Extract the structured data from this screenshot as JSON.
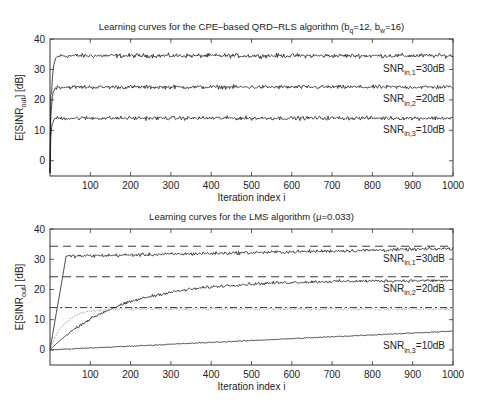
{
  "chart_data": [
    {
      "type": "line",
      "title": "Learning curves for the CPE–based QRD–RLS algorithm (b",
      "title_parts": {
        "main": "Learning curves for the CPE–based QRD–RLS algorithm (b",
        "sub1": "q",
        "mid": "=12, b",
        "sub2": "w",
        "end": "=16)"
      },
      "xlabel": "Iteration index i",
      "ylabel": "E[SINR",
      "ylabel_sub": "out",
      "ylabel_end": "] [dB]",
      "xlim": [
        0,
        1000
      ],
      "ylim": [
        -5,
        40
      ],
      "xticks": [
        100,
        200,
        300,
        400,
        500,
        600,
        700,
        800,
        900,
        1000
      ],
      "yticks": [
        0,
        10,
        20,
        30,
        40
      ],
      "box": {
        "left": 50,
        "right": 453,
        "top": 39,
        "bottom": 176
      },
      "series": [
        {
          "name": "SNR_in,1=30dB",
          "label": "SNR",
          "sub": "in,1",
          "tail": "=30dB",
          "steady": 34.5,
          "tau": 4,
          "noise": 0.5,
          "style": "solid",
          "color": "#1a1a1a",
          "label_y": 30.5
        },
        {
          "name": "SNR_in,2=20dB",
          "label": "SNR",
          "sub": "in,2",
          "tail": "=20dB",
          "steady": 24.2,
          "tau": 3,
          "noise": 0.45,
          "style": "solid",
          "color": "#1a1a1a",
          "label_y": 20.5
        },
        {
          "name": "SNR_in,3=10dB",
          "label": "SNR",
          "sub": "in,3",
          "tail": "=10dB",
          "steady": 14.0,
          "tau": 3,
          "noise": 0.45,
          "style": "solid",
          "color": "#1a1a1a",
          "label_y": 10.5
        }
      ]
    },
    {
      "type": "line",
      "title": "Learning curves for the LMS algorithm (μ=0.033)",
      "xlabel": "Iteration index i",
      "ylabel": "E[SINR",
      "ylabel_sub": "out",
      "ylabel_end": "] [dB]",
      "xlim": [
        0,
        1000
      ],
      "ylim": [
        -5,
        40
      ],
      "xticks": [
        100,
        200,
        300,
        400,
        500,
        600,
        700,
        800,
        900,
        1000
      ],
      "yticks": [
        0,
        10,
        20,
        30,
        40
      ],
      "box": {
        "left": 50,
        "right": 453,
        "top": 229,
        "bottom": 365
      },
      "reference_lines": [
        {
          "y": 34.3,
          "style": "dashed",
          "color": "#222"
        },
        {
          "y": 24.2,
          "style": "dashed",
          "color": "#222"
        },
        {
          "y": 14.0,
          "style": "dashdot",
          "color": "#222"
        }
      ],
      "series": [
        {
          "name": "SNR_in,1=30dB",
          "label": "SNR",
          "sub": "in,1",
          "tail": "=30dB",
          "kind": "fast",
          "steady": 33.5,
          "start_level": 31,
          "knee": 50,
          "noise": 0.4,
          "style": "solid",
          "color": "#1a1a1a",
          "label_y": 30.5
        },
        {
          "name": "SNR_in,2=20dB",
          "label": "SNR",
          "sub": "in,2",
          "tail": "=20dB",
          "kind": "medium",
          "steady": 23.0,
          "tau": 170,
          "noise": 0.35,
          "style": "solid",
          "color": "#1a1a1a",
          "label_y": 20.5
        },
        {
          "name": "dotted-10dB",
          "kind": "dotted",
          "steady": 13.5,
          "tau": 35,
          "noise": 0.3,
          "style": "dotted",
          "color": "#999"
        },
        {
          "name": "SNR_in,3=10dB",
          "label": "SNR",
          "sub": "in,3",
          "tail": "=10dB",
          "kind": "slow",
          "end_value": 6.2,
          "noise": 0.12,
          "style": "solid",
          "color": "#1a1a1a",
          "label_y": 1.5
        }
      ]
    }
  ]
}
